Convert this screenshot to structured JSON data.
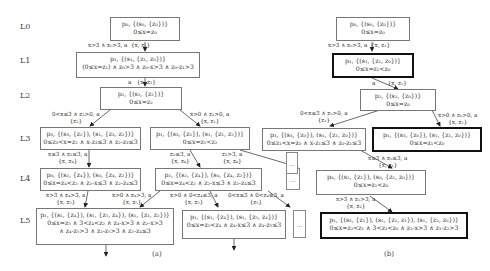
{
  "levels": [
    "L0",
    "L1",
    "L2",
    "L3",
    "L4",
    "L5"
  ],
  "diagram_a": {
    "caption": "(a)",
    "nodes": {
      "n0": {
        "l1": "p₀, {(s₀, {z₀})}",
        "l2": "0≤x=z₀"
      },
      "n1": {
        "l1": "p₁, {(s₁, {z₁, z₀})}",
        "l2": "(0≤x=z₁) ∧ z₀>3 ∧ z₀-x>3 ∧ z₀-z₁>3"
      },
      "n2": {
        "l1": "p₂, {(s₂, {z₂})}",
        "l2": "0≤x=z₂"
      },
      "n3a": {
        "l1": "p₃, {(s₃, {z₂}), (s₁, {z₃, z₂})}",
        "l2": "0≤z₃<x=z₂ ∧ x-z₃≤3 ∧ z₂-z₃≤3"
      },
      "n3b": {
        "l1": "p₁, {(s₃, {z₂}), (s₁, {z₁, z₂})}",
        "l2": "0≤x=z₁<z₂"
      },
      "n4a": {
        "l1": "p₀, {(s₂, {z₄}), (s₀, {z₄, z₂})}",
        "l2": "0≤x=z₄<z₂ ∧ z₂-x≤3 ∧ z₂-z₄≤3"
      },
      "n4b": {
        "l1": "p₂, {(s₂, {z₄}), (s₀, {z₄, z₂})}",
        "l2": "0≤x=z₄<z₂ ∧ z₂-x≤3 ∧ z₂-z₄≤3"
      },
      "n5a": {
        "l1": "p₁, {(s₁, {z₄}), (s₁, {z₅, z₄}), (s₁, {z₁, z₂})}",
        "l2": "0≤x=z₅ ∧ 3<z₄<z₂ ∧ z₄-x>3 ∧ z₂-x>3",
        "l3": "∧ z₄-z₅>3 ∧ z₂-z₅>3 ∧ z₂-z₄≤3"
      },
      "n5b": {
        "l1": "p₁, {(s₁, {z₄}), (s₁, {z₅, z₄})}",
        "l2": "0≤x=z₅<z₄ ∧ z₄-x≤3 ∧ z₄-z₅≤3"
      }
    },
    "edges": {
      "e01": {
        "guard": "x>3 ∧ z₀>3, a",
        "reset": "{x, z₁}"
      },
      "e12": {
        "guard": "a",
        "reset": "{x, z₂}"
      },
      "e2_3a": {
        "guard": "0<x≤3 ∧ z₂>0, a",
        "reset": "{z₃}"
      },
      "e2_3b": {
        "guard": "x>0 ∧ z₂>0, a",
        "reset": "{x, z₁}"
      },
      "e3a_4a": {
        "guard": "x≤3 ∧ z₂≤3, a",
        "reset": "{x, z₄}"
      },
      "e3b_4b": {
        "guard": "z₂≤3, a",
        "reset": "{x, z₄}"
      },
      "e3b_more": {
        "guard": "z₂>3, a",
        "reset": "{x, z₄}"
      },
      "e4a_5a": {
        "guard": "x>3 ∧ z₄>3, a",
        "reset": "{x, z₅}"
      },
      "e4b_5a": {
        "guard": "x>0 ∧ z₄>3, a",
        "reset": "{x, z₅}"
      },
      "e4b_5b": {
        "guard": "x>0 ∧ 0<z₄≤3, a",
        "reset": "{x, z₅}"
      },
      "e4b_more": {
        "guard": "0<x≤3 ∧ 0<z₄≤3, a",
        "reset": "{z₅}"
      }
    },
    "ellipsis": "..."
  },
  "diagram_b": {
    "caption": "(b)",
    "nodes": {
      "n0": {
        "l1": "p₀, {(s₀, {z₀})}",
        "l2": "0≤x=z₀"
      },
      "n1": {
        "l1": "p₁, {(s₁, {z₁, z₀})}",
        "l2": "0≤x=z₁<z₀"
      },
      "n2": {
        "l1": "p₂, {(s₂, {z₀})}",
        "l2": "0≤x=z₀"
      },
      "n3a": {
        "l1": "p₃, {(s₃, {z₀}), (s₁, {z₁, z₀})}",
        "l2": "0≤z₁<x=z₀ ∧ x-z₁≤3 ∧ z₀-z₁≤3"
      },
      "n3b": {
        "l1": "p₁, {(s₃, {z₀}), (s₁, {z₁, z₀})}",
        "l2": "0≤x=z₁<z₀"
      },
      "n4": {
        "l1": "p₀, {(s₂, {z₁}), (s₀, {z₁, z₀})}",
        "l2": "0≤x=z₁<z₀"
      },
      "n5": {
        "l1": "p₁, {(s₃, {z₁}), (s₁, {z₂, z₁}), (s₁, {z₂, z₀})}",
        "l2": "0≤x=z₂<z₁ ∧ 3<z₁<z₀ ∧ z₁-x>3 ∧ z₁-z₂>3"
      }
    },
    "edges": {
      "e01": {
        "guard": "x>3 ∧ z₀>3, a",
        "reset": "{x, z₁}"
      },
      "e12": {
        "guard": "a",
        "reset": "{x, z₀}"
      },
      "e2_3a": {
        "guard": "0<x≤3 ∧ z₀>0, a",
        "reset": "{z₁}"
      },
      "e2_3b": {
        "guard": "x>0 ∧ z₀>0, a",
        "reset": "{x, z₁}"
      },
      "e3a_4": {
        "guard": "x≤3 ∧ z₀≤3, a",
        "reset": "{x, z₁}"
      },
      "e4_5": {
        "guard": "x>3 ∧ z₁>3, a",
        "reset": "{x, z₂}"
      }
    },
    "ellipsis": "..."
  }
}
